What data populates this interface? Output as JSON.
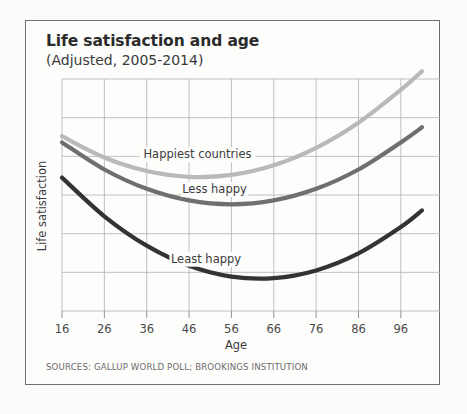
{
  "header": {
    "title": "Life satisfaction and age",
    "subtitle": "(Adjusted, 2005-2014)"
  },
  "footer": {
    "sources": "SOURCES: GALLUP WORLD POLL; BROOKINGS INSTITUTION"
  },
  "labels": {
    "happiest": "Happiest countries",
    "less_happy": "Less happy",
    "least_happy": "Least happy"
  },
  "axis": {
    "x_title": "Age",
    "y_title": "Life satisfaction",
    "x_ticks": [
      "16",
      "26",
      "36",
      "46",
      "56",
      "66",
      "76",
      "86",
      "96"
    ]
  },
  "colors": {
    "happiest": "#b9b9b9",
    "less_happy": "#6f6f6f",
    "least_happy": "#333333",
    "grid": "#b0b0b0",
    "border": "#6e6e6e",
    "text": "#3c3c3c"
  },
  "chart_data": {
    "type": "line",
    "title": "Life satisfaction and age",
    "subtitle": "(Adjusted, 2005-2014)",
    "xlabel": "Age",
    "ylabel": "Life satisfaction",
    "xlim": [
      16,
      101
    ],
    "ylim": [
      0,
      6
    ],
    "grid": true,
    "legend": "inline-annotations",
    "x_ticks": [
      16,
      26,
      36,
      46,
      56,
      66,
      76,
      86,
      96
    ],
    "y_ticks": [],
    "x": [
      16,
      26,
      36,
      46,
      56,
      66,
      76,
      86,
      96,
      101
    ],
    "series": [
      {
        "name": "Happiest countries",
        "color": "#b9b9b9",
        "values": [
          4.52,
          3.97,
          3.62,
          3.47,
          3.52,
          3.77,
          4.22,
          4.87,
          5.72,
          6.2
        ],
        "minimum_age": 50
      },
      {
        "name": "Less happy",
        "color": "#6f6f6f",
        "values": [
          4.36,
          3.66,
          3.16,
          2.86,
          2.76,
          2.86,
          3.16,
          3.66,
          4.36,
          4.75
        ],
        "minimum_age": 57
      },
      {
        "name": "Least happy",
        "color": "#333333",
        "values": [
          3.45,
          2.45,
          1.69,
          1.17,
          0.89,
          0.85,
          1.05,
          1.49,
          2.17,
          2.6
        ],
        "minimum_age": 60
      }
    ],
    "annotations": [
      {
        "text": "Happiest countries",
        "x": 48,
        "y": 3.95
      },
      {
        "text": "Less happy",
        "x": 52,
        "y": 3.05
      },
      {
        "text": "Least happy",
        "x": 50,
        "y": 1.25
      }
    ]
  }
}
